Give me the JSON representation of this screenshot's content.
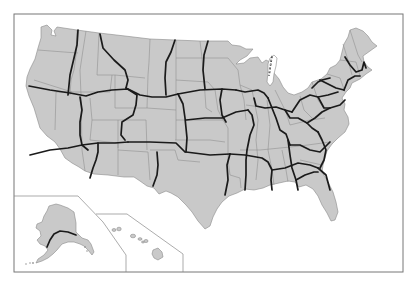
{
  "map": {
    "title": "",
    "region": "United States",
    "insets": [
      "Alaska",
      "Hawaii"
    ],
    "colors": {
      "land": "#c9c9c9",
      "state_borders": "#8c8c8c",
      "route_lines": "#1a1a1a",
      "water": "#ffffff",
      "frame": "#777777"
    },
    "features": {
      "route_lines": "thick black lines crossing states",
      "ferry_route": "dashed line across Lake Michigan"
    }
  }
}
